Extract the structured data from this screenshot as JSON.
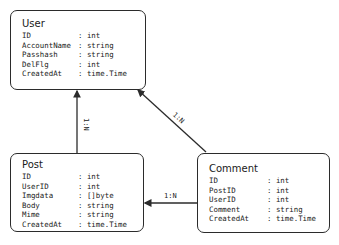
{
  "entities": {
    "user": {
      "title": "User",
      "fields": [
        {
          "name": "ID",
          "type": ": int"
        },
        {
          "name": "AccountName",
          "type": ": string"
        },
        {
          "name": "Passhash",
          "type": ": string"
        },
        {
          "name": "DelFlg",
          "type": ": int"
        },
        {
          "name": "CreatedAt",
          "type": ": time.Time"
        }
      ]
    },
    "post": {
      "title": "Post",
      "fields": [
        {
          "name": "ID",
          "type": ": int"
        },
        {
          "name": "UserID",
          "type": ": int"
        },
        {
          "name": "Imgdata",
          "type": ": []byte"
        },
        {
          "name": "Body",
          "type": ": string"
        },
        {
          "name": "Mime",
          "type": ": string"
        },
        {
          "name": "CreatedAt",
          "type": ": time.Time"
        }
      ]
    },
    "comment": {
      "title": "Comment",
      "fields": [
        {
          "name": "ID",
          "type": ": int"
        },
        {
          "name": "PostID",
          "type": ": int"
        },
        {
          "name": "UserID",
          "type": ": int"
        },
        {
          "name": "Comment",
          "type": ": string"
        },
        {
          "name": "CreatedAt",
          "type": ": time.Time"
        }
      ]
    }
  },
  "relations": [
    {
      "from": "Post",
      "to": "User",
      "cardinality": "1:N"
    },
    {
      "from": "Comment",
      "to": "User",
      "cardinality": "1:N"
    },
    {
      "from": "Comment",
      "to": "Post",
      "cardinality": "1:N"
    }
  ],
  "colors": {
    "stroke": "#2b2b2b",
    "background": "#ffffff"
  }
}
